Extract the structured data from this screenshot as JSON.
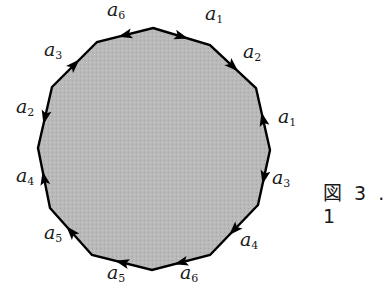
{
  "figure": {
    "caption": "図 3 . 1",
    "fill_color": "#b8b8b8",
    "stroke_color": "#000000",
    "vertices": [
      [
        153,
        28
      ],
      [
        210,
        45
      ],
      [
        256,
        88
      ],
      [
        270,
        150
      ],
      [
        258,
        205
      ],
      [
        210,
        255
      ],
      [
        152,
        270
      ],
      [
        92,
        255
      ],
      [
        50,
        208
      ],
      [
        38,
        148
      ],
      [
        52,
        87
      ],
      [
        97,
        42
      ]
    ],
    "edges": [
      {
        "label": "a",
        "sub": "1",
        "from": 0,
        "to": 1,
        "direction": "forward",
        "label_pos": [
          205,
          24
        ]
      },
      {
        "label": "a",
        "sub": "2",
        "from": 1,
        "to": 2,
        "direction": "forward",
        "label_pos": [
          243,
          62
        ]
      },
      {
        "label": "a",
        "sub": "1",
        "from": 2,
        "to": 3,
        "direction": "backward",
        "label_pos": [
          278,
          127
        ]
      },
      {
        "label": "a",
        "sub": "3",
        "from": 3,
        "to": 4,
        "direction": "forward",
        "label_pos": [
          272,
          188
        ]
      },
      {
        "label": "a",
        "sub": "4",
        "from": 4,
        "to": 5,
        "direction": "forward",
        "label_pos": [
          240,
          250
        ]
      },
      {
        "label": "a",
        "sub": "6",
        "from": 5,
        "to": 6,
        "direction": "forward",
        "label_pos": [
          180,
          283
        ]
      },
      {
        "label": "a",
        "sub": "5",
        "from": 6,
        "to": 7,
        "direction": "forward",
        "label_pos": [
          107,
          283
        ]
      },
      {
        "label": "a",
        "sub": "5",
        "from": 7,
        "to": 8,
        "direction": "forward",
        "label_pos": [
          44,
          243
        ]
      },
      {
        "label": "a",
        "sub": "4",
        "from": 8,
        "to": 9,
        "direction": "forward",
        "label_pos": [
          16,
          186
        ]
      },
      {
        "label": "a",
        "sub": "2",
        "from": 9,
        "to": 10,
        "direction": "backward",
        "label_pos": [
          16,
          117
        ]
      },
      {
        "label": "a",
        "sub": "3",
        "from": 10,
        "to": 11,
        "direction": "forward",
        "label_pos": [
          44,
          60
        ]
      },
      {
        "label": "a",
        "sub": "6",
        "from": 11,
        "to": 0,
        "direction": "backward",
        "label_pos": [
          107,
          20
        ]
      }
    ]
  }
}
